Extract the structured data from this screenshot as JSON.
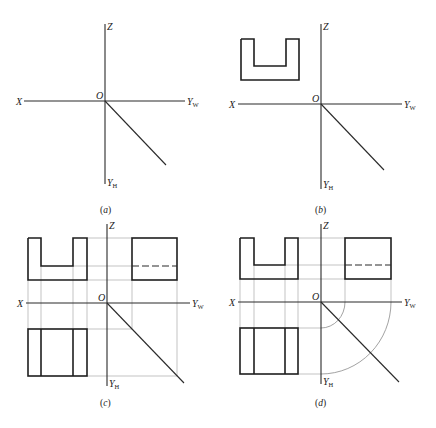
{
  "figure": {
    "axis_labels": {
      "x": "X",
      "z": "Z",
      "origin": "O",
      "y_w": "Y",
      "y_w_sub": "W",
      "y_h": "Y",
      "y_h_sub": "H"
    },
    "panels": [
      {
        "id": "a",
        "caption_prefix": "(",
        "caption_letter": "a",
        "caption_suffix": ")",
        "content": "axes only with 45° miter line"
      },
      {
        "id": "b",
        "caption_prefix": "(",
        "caption_letter": "b",
        "caption_suffix": ")",
        "content": "front view (U-shape) added"
      },
      {
        "id": "c",
        "caption_prefix": "(",
        "caption_letter": "c",
        "caption_suffix": ")",
        "content": "front, side and top views with 45° miter projection lines"
      },
      {
        "id": "d",
        "caption_prefix": "(",
        "caption_letter": "d",
        "caption_suffix": ")",
        "content": "front, side and top views with arc projection lines"
      }
    ],
    "colors": {
      "line": "#1e1e1e",
      "projection_line": "#9a9a9a",
      "background": "#ffffff"
    }
  }
}
